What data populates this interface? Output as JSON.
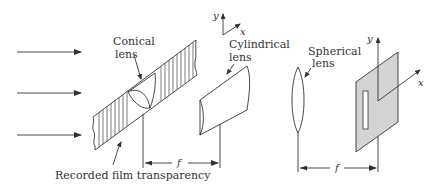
{
  "diagram": {
    "type": "optical-system",
    "labels": {
      "conical_lens_line1": "Conical",
      "conical_lens_line2": "lens",
      "cylindrical_lens_line1": "Cylindrical",
      "cylindrical_lens_line2": "lens",
      "spherical_lens_line1": "Spherical",
      "spherical_lens_line2": "lens",
      "film": "Recorded film transparency",
      "focal_1": "f",
      "focal_2": "f",
      "axis_small_y": "y",
      "axis_small_x": "x",
      "axis_plane_y": "y",
      "axis_plane_x": "x"
    },
    "components": [
      "incident-light-rays",
      "recorded-film-transparency",
      "conical-lens",
      "cylindrical-lens",
      "spherical-lens",
      "output-plane-with-slit"
    ],
    "colors": {
      "line": "#333333",
      "plate_fill": "#d4d4d4",
      "background": "#ffffff"
    }
  }
}
